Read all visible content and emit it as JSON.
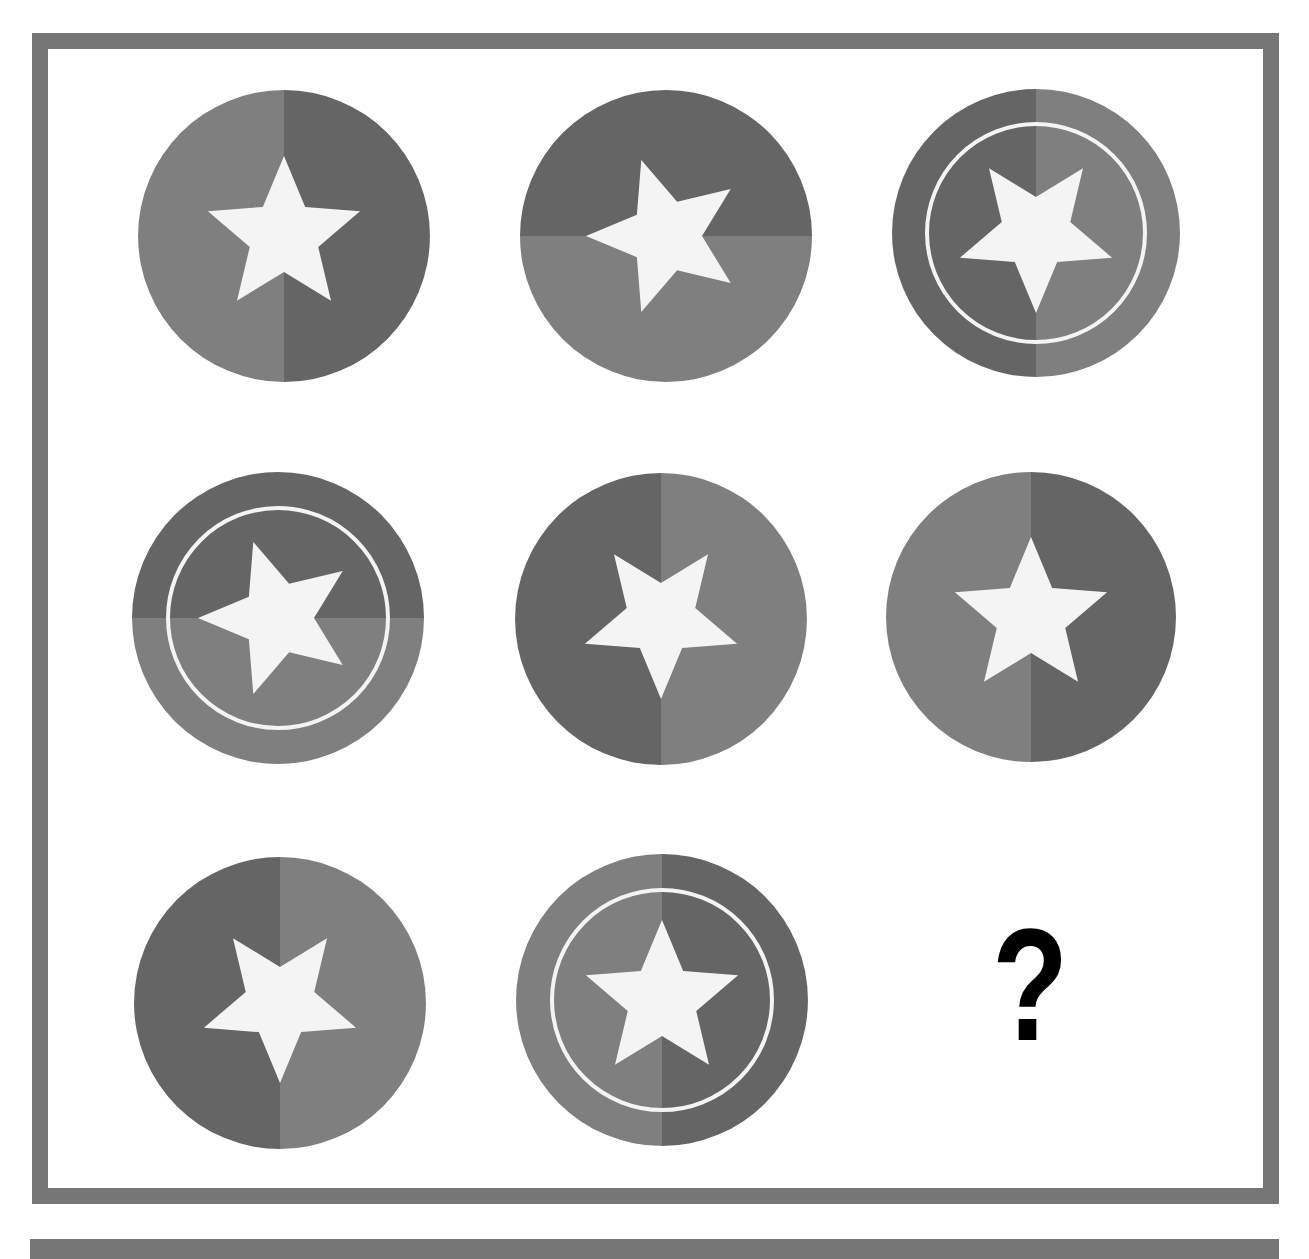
{
  "puzzle": {
    "type": "matrix-reasoning",
    "grid": "3x3",
    "missing_symbol": "?",
    "colors": {
      "border": "#767676",
      "light_half": "#7f7f7f",
      "dark_half": "#656565",
      "star": "#f4f4f4",
      "ring": "#f4f4f4"
    },
    "cells": [
      {
        "row": 1,
        "col": 1,
        "cx": 284,
        "cy": 236,
        "r": 146,
        "split": "vertical",
        "dark_side": "right",
        "ring": false,
        "star_direction": "up"
      },
      {
        "row": 1,
        "col": 2,
        "cx": 666,
        "cy": 236,
        "r": 146,
        "split": "horizontal",
        "dark_side": "top",
        "ring": false,
        "star_direction": "left"
      },
      {
        "row": 1,
        "col": 3,
        "cx": 1036,
        "cy": 233,
        "r": 144,
        "split": "vertical",
        "dark_side": "left",
        "ring": true,
        "star_direction": "down"
      },
      {
        "row": 2,
        "col": 1,
        "cx": 278,
        "cy": 618,
        "r": 146,
        "split": "horizontal",
        "dark_side": "top",
        "ring": true,
        "star_direction": "left"
      },
      {
        "row": 2,
        "col": 2,
        "cx": 661,
        "cy": 619,
        "r": 146,
        "split": "vertical",
        "dark_side": "left",
        "ring": false,
        "star_direction": "down"
      },
      {
        "row": 2,
        "col": 3,
        "cx": 1031,
        "cy": 617,
        "r": 145,
        "split": "vertical",
        "dark_side": "right",
        "ring": false,
        "star_direction": "up"
      },
      {
        "row": 3,
        "col": 1,
        "cx": 280,
        "cy": 1003,
        "r": 146,
        "split": "vertical",
        "dark_side": "left",
        "ring": false,
        "star_direction": "down"
      },
      {
        "row": 3,
        "col": 2,
        "cx": 662,
        "cy": 1000,
        "r": 146,
        "split": "vertical",
        "dark_side": "right",
        "ring": true,
        "star_direction": "up"
      },
      {
        "row": 3,
        "col": 3,
        "missing": true,
        "label": "?"
      }
    ]
  }
}
